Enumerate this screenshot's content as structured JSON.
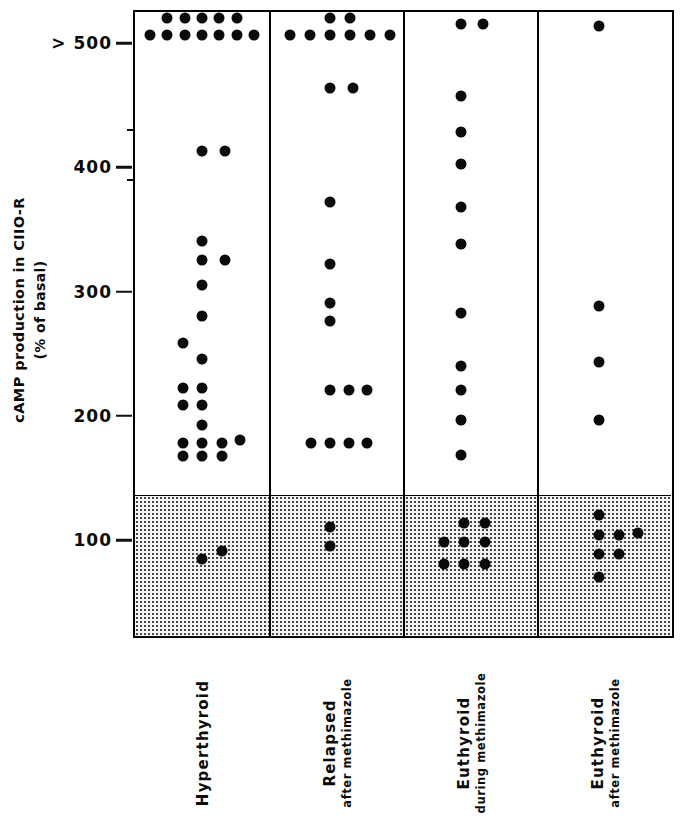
{
  "chart_data": {
    "type": "scatter",
    "title": "",
    "xlabel": "",
    "ylabel_line1": "cAMP production in CIIO-R",
    "ylabel_line2": "(% of basal)",
    "ylim": [
      0,
      560
    ],
    "grid": false,
    "legend": "none",
    "y_ticks": [
      {
        "label": "> 500",
        "value": 500
      },
      {
        "label": "400",
        "value": 400
      },
      {
        "label": "300",
        "value": 300
      },
      {
        "label": "200",
        "value": 200
      },
      {
        "label": "100",
        "value": 100
      }
    ],
    "minor_ticks": [
      430,
      390
    ],
    "shaded_band": {
      "label": "normal basal range",
      "from": 0,
      "to": 136,
      "color": "#f3f3f3"
    },
    "categories": [
      {
        "label": "Hyperthyroid",
        "sublabel": ""
      },
      {
        "label": "Relapsed",
        "sublabel": "after methimazole"
      },
      {
        "label": "Euthyroid",
        "sublabel": "during methimazole"
      },
      {
        "label": "Euthyroid",
        "sublabel": "after methimazole"
      }
    ],
    "series": [
      {
        "name": "Hyperthyroid",
        "n": 26,
        "points": [
          {
            "offset": -0.26,
            "value": 520
          },
          {
            "offset": -0.13,
            "value": 520
          },
          {
            "offset": 0.0,
            "value": 520
          },
          {
            "offset": 0.13,
            "value": 520
          },
          {
            "offset": 0.26,
            "value": 520
          },
          {
            "offset": -0.39,
            "value": 506
          },
          {
            "offset": -0.26,
            "value": 506
          },
          {
            "offset": -0.13,
            "value": 506
          },
          {
            "offset": 0.0,
            "value": 506
          },
          {
            "offset": 0.13,
            "value": 506
          },
          {
            "offset": 0.26,
            "value": 506
          },
          {
            "offset": 0.39,
            "value": 506
          },
          {
            "offset": 0.0,
            "value": 413
          },
          {
            "offset": 0.17,
            "value": 413
          },
          {
            "offset": 0.0,
            "value": 340
          },
          {
            "offset": 0.0,
            "value": 325
          },
          {
            "offset": 0.17,
            "value": 325
          },
          {
            "offset": 0.0,
            "value": 305
          },
          {
            "offset": 0.0,
            "value": 280
          },
          {
            "offset": -0.14,
            "value": 258
          },
          {
            "offset": 0.0,
            "value": 245
          },
          {
            "offset": -0.14,
            "value": 222
          },
          {
            "offset": 0.0,
            "value": 222
          },
          {
            "offset": -0.14,
            "value": 208
          },
          {
            "offset": 0.0,
            "value": 208
          },
          {
            "offset": 0.0,
            "value": 192
          },
          {
            "offset": -0.14,
            "value": 178
          },
          {
            "offset": 0.0,
            "value": 178
          },
          {
            "offset": 0.15,
            "value": 178
          },
          {
            "offset": 0.28,
            "value": 180
          },
          {
            "offset": -0.14,
            "value": 167
          },
          {
            "offset": 0.0,
            "value": 167
          },
          {
            "offset": 0.15,
            "value": 167
          },
          {
            "offset": 0.0,
            "value": 84
          },
          {
            "offset": 0.15,
            "value": 91
          }
        ]
      },
      {
        "name": "Relapsed after methimazole",
        "n": 18,
        "points": [
          {
            "offset": -0.06,
            "value": 520
          },
          {
            "offset": 0.09,
            "value": 520
          },
          {
            "offset": -0.36,
            "value": 506
          },
          {
            "offset": -0.21,
            "value": 506
          },
          {
            "offset": -0.06,
            "value": 506
          },
          {
            "offset": 0.09,
            "value": 506
          },
          {
            "offset": 0.24,
            "value": 506
          },
          {
            "offset": 0.39,
            "value": 506
          },
          {
            "offset": -0.06,
            "value": 463
          },
          {
            "offset": 0.11,
            "value": 463
          },
          {
            "offset": -0.06,
            "value": 372
          },
          {
            "offset": -0.06,
            "value": 322
          },
          {
            "offset": -0.06,
            "value": 290
          },
          {
            "offset": -0.06,
            "value": 276
          },
          {
            "offset": -0.06,
            "value": 220
          },
          {
            "offset": 0.08,
            "value": 220
          },
          {
            "offset": 0.22,
            "value": 220
          },
          {
            "offset": -0.2,
            "value": 178
          },
          {
            "offset": -0.06,
            "value": 178
          },
          {
            "offset": 0.08,
            "value": 178
          },
          {
            "offset": 0.22,
            "value": 178
          },
          {
            "offset": -0.06,
            "value": 110
          },
          {
            "offset": -0.06,
            "value": 95
          }
        ]
      },
      {
        "name": "Euthyroid during methimazole",
        "n": 19,
        "points": [
          {
            "offset": -0.08,
            "value": 515
          },
          {
            "offset": 0.08,
            "value": 515
          },
          {
            "offset": -0.08,
            "value": 457
          },
          {
            "offset": -0.08,
            "value": 428
          },
          {
            "offset": -0.08,
            "value": 402
          },
          {
            "offset": -0.08,
            "value": 368
          },
          {
            "offset": -0.08,
            "value": 338
          },
          {
            "offset": -0.08,
            "value": 282
          },
          {
            "offset": -0.08,
            "value": 240
          },
          {
            "offset": -0.08,
            "value": 220
          },
          {
            "offset": -0.08,
            "value": 196
          },
          {
            "offset": -0.08,
            "value": 168
          },
          {
            "offset": -0.06,
            "value": 113
          },
          {
            "offset": 0.1,
            "value": 113
          },
          {
            "offset": -0.21,
            "value": 98
          },
          {
            "offset": -0.06,
            "value": 98
          },
          {
            "offset": 0.1,
            "value": 98
          },
          {
            "offset": -0.21,
            "value": 80
          },
          {
            "offset": -0.06,
            "value": 80
          },
          {
            "offset": 0.1,
            "value": 80
          }
        ]
      },
      {
        "name": "Euthyroid after methimazole",
        "n": 11,
        "points": [
          {
            "offset": -0.05,
            "value": 513
          },
          {
            "offset": -0.05,
            "value": 288
          },
          {
            "offset": -0.05,
            "value": 243
          },
          {
            "offset": -0.05,
            "value": 196
          },
          {
            "offset": -0.05,
            "value": 120
          },
          {
            "offset": -0.05,
            "value": 104
          },
          {
            "offset": 0.1,
            "value": 104
          },
          {
            "offset": 0.24,
            "value": 105
          },
          {
            "offset": -0.05,
            "value": 88
          },
          {
            "offset": 0.1,
            "value": 88
          },
          {
            "offset": -0.05,
            "value": 70
          }
        ]
      }
    ]
  }
}
